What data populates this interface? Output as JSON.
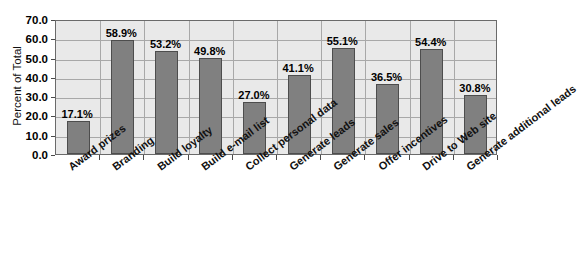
{
  "chart_data": {
    "type": "bar",
    "title": "",
    "xlabel": "",
    "ylabel": "Percent of Total",
    "ylim": [
      0,
      70
    ],
    "ytick_step": 10,
    "ytick_labels": [
      "0.0",
      "10.0",
      "20.0",
      "30.0",
      "40.0",
      "50.0",
      "60.0",
      "70.0"
    ],
    "grid": true,
    "legend": "none",
    "categories": [
      "Award prizes",
      "Branding",
      "Build loyalty",
      "Build e-mail list",
      "Collect personal data",
      "Generate leads",
      "Generate sales",
      "Offer incentives",
      "Drive to Web site",
      "Generate additional leads"
    ],
    "values": [
      17.1,
      58.9,
      53.2,
      49.8,
      27.0,
      41.1,
      55.1,
      36.5,
      54.4,
      30.8
    ],
    "value_labels": [
      "17.1%",
      "58.9%",
      "53.2%",
      "49.8%",
      "27.0%",
      "41.1%",
      "55.1%",
      "36.5%",
      "54.4%",
      "30.8%"
    ],
    "colors": {
      "bar_fill": "#808080",
      "bar_edge": "#4d4d4d",
      "plot_background": "#e9e9e9",
      "gridline": "#a8a8a8",
      "axis": "#6a6a6a",
      "text": "#000000"
    }
  },
  "footer": {
    "source_note": ""
  }
}
